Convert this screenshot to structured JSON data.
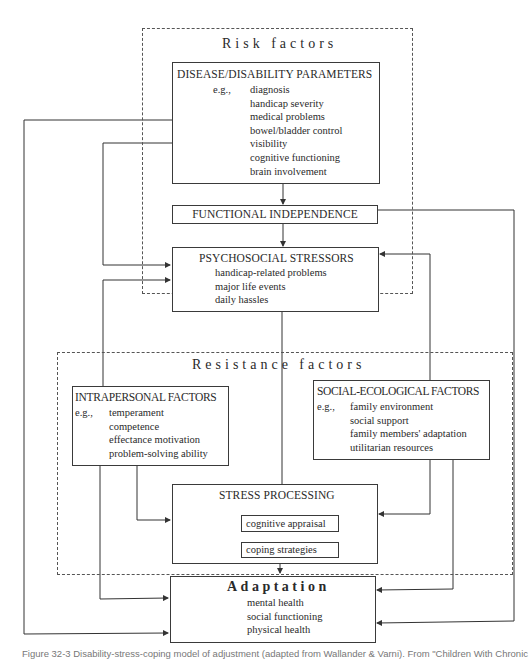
{
  "figure": {
    "risk_factors": {
      "label": "Risk factors",
      "disease_parameters": {
        "title": "DISEASE/DISABILITY PARAMETERS",
        "eg": "e.g.,",
        "items": [
          "diagnosis",
          "handicap severity",
          "medical problems",
          "bowel/bladder control",
          "visibility",
          "cognitive functioning",
          "brain involvement"
        ]
      },
      "functional_independence": {
        "title": "FUNCTIONAL INDEPENDENCE"
      },
      "psychosocial_stressors": {
        "title": "PSYCHOSOCIAL STRESSORS",
        "items": [
          "handicap-related problems",
          "major life events",
          "daily hassles"
        ]
      }
    },
    "resistance_factors": {
      "label": "Resistance factors",
      "intrapersonal": {
        "title": "INTRAPERSONAL FACTORS",
        "eg": "e.g.,",
        "items": [
          "temperament",
          "competence",
          "effectance motivation",
          "problem-solving ability"
        ]
      },
      "social_ecological": {
        "title": "SOCIAL-ECOLOGICAL FACTORS",
        "eg": "e.g.,",
        "items": [
          "family environment",
          "social support",
          "family members' adaptation",
          "utilitarian resources"
        ]
      },
      "stress_processing": {
        "title": "STRESS PROCESSING",
        "items": [
          "cognitive appraisal",
          "coping strategies"
        ]
      }
    },
    "adaptation": {
      "title": "Adaptation",
      "items": [
        "mental health",
        "social functioning",
        "physical health"
      ]
    },
    "caption": "Figure 32-3  Disability-stress-coping model of adjustment (adapted from Wallander & Varni). From \"Children With Chronic"
  }
}
